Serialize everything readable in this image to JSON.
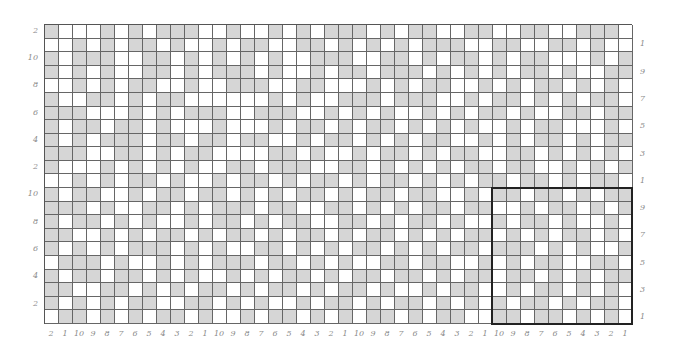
{
  "grid": {
    "rows": 22,
    "cols": 42,
    "colors": {
      "filled": "#d6d6d6",
      "empty": "#ffffff",
      "line": "#666666",
      "highlight_border": "#222222"
    },
    "cells": [
      "100010101110010010101110101100110011001110",
      "001010110100101100110101010111001100110100",
      "101110011010101010011100110101101011000101",
      "101010011010111010010110111010101011010011",
      "001010110010011100110001010110010101101010",
      "100110101100000010100111011100101101010110",
      "111000101011100111001010100101011010011011",
      "101101101000100010110101101010100101100010",
      "101011101101101100101101010110010101101011",
      "111001101011000011010010110101100110101010",
      "100010101010011011100110101010110110010101",
      "001010110100101101011010110101011011010110",
      "101100101101101010110101101100101101101011",
      "111010011010111011001101010110110010110101",
      "101101010010110101100110101101001011010010",
      "110010101101011010110101101010110101011010",
      "101010111010100110101011010101101110101001",
      "011101001010111011010100110110010101100110",
      "101101101010010101101011011010110110101011",
      "110011010101101011010110100101100101101010",
      "101010110011010100101101011010101011010110",
      "011010101101001011010101101011001101101010"
    ],
    "highlight": {
      "label": "highlighted-region",
      "col_start": 32,
      "col_end": 41,
      "row_start": 12,
      "row_end": 21
    }
  },
  "labels": {
    "left": [
      {
        "row": 0,
        "text": "2"
      },
      {
        "row": 2,
        "text": "10"
      },
      {
        "row": 4,
        "text": "8"
      },
      {
        "row": 6,
        "text": "6"
      },
      {
        "row": 8,
        "text": "4"
      },
      {
        "row": 10,
        "text": "2"
      },
      {
        "row": 12,
        "text": "10"
      },
      {
        "row": 14,
        "text": "8"
      },
      {
        "row": 16,
        "text": "6"
      },
      {
        "row": 18,
        "text": "4"
      },
      {
        "row": 20,
        "text": "2"
      }
    ],
    "right": [
      {
        "row": 1,
        "text": "1"
      },
      {
        "row": 3,
        "text": "9"
      },
      {
        "row": 5,
        "text": "7"
      },
      {
        "row": 7,
        "text": "5"
      },
      {
        "row": 9,
        "text": "3"
      },
      {
        "row": 11,
        "text": "1"
      },
      {
        "row": 13,
        "text": "9"
      },
      {
        "row": 15,
        "text": "7"
      },
      {
        "row": 17,
        "text": "5"
      },
      {
        "row": 19,
        "text": "3"
      },
      {
        "row": 21,
        "text": "1"
      }
    ],
    "bottom": [
      "2",
      "1",
      "10",
      "9",
      "8",
      "7",
      "6",
      "5",
      "4",
      "3",
      "2",
      "1",
      "10",
      "9",
      "8",
      "7",
      "6",
      "5",
      "4",
      "3",
      "2",
      "1",
      "10",
      "9",
      "8",
      "7",
      "6",
      "5",
      "4",
      "3",
      "2",
      "1",
      "10",
      "9",
      "8",
      "7",
      "6",
      "5",
      "4",
      "3",
      "2",
      "1"
    ]
  }
}
